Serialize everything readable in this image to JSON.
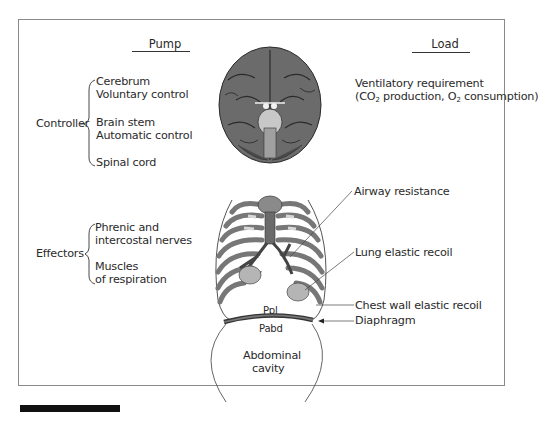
{
  "figure": {
    "columns": {
      "left_header": "Pump",
      "right_header": "Load"
    },
    "pump": {
      "controller": {
        "label": "Controller",
        "items": [
          {
            "line1": "Cerebrum",
            "line2": "Voluntary control"
          },
          {
            "line1": "Brain stem",
            "line2": "Automatic control"
          },
          {
            "line1": "Spinal cord",
            "line2": ""
          }
        ]
      },
      "effectors": {
        "label": "Effectors",
        "items": [
          {
            "line1": "Phrenic and",
            "line2": "intercostal nerves"
          },
          {
            "line1": "Muscles",
            "line2": "of respiration"
          }
        ]
      }
    },
    "load": {
      "ventilatory_requirement": {
        "line1": "Ventilatory requirement",
        "line2_prefix": "(CO",
        "line2_sub1": "2",
        "line2_mid": " production, O",
        "line2_sub2": "2",
        "line2_suffix": " consumption)"
      },
      "callouts": [
        "Airway resistance",
        "Lung elastic recoil",
        "Chest wall elastic recoil",
        "Diaphragm"
      ]
    },
    "anatomy_labels": {
      "delta_v_left": "ΔV",
      "delta_v_right": "ΔV",
      "pleural_pressure": "Ppl",
      "abdominal_pressure": "Pabd",
      "abdominal_cavity_line1": "Abdominal",
      "abdominal_cavity_line2": "cavity"
    },
    "illustrations": {
      "brain": "brain-inferior-view-illustration",
      "thorax": "rib-cage-and-lungs-illustration"
    }
  }
}
